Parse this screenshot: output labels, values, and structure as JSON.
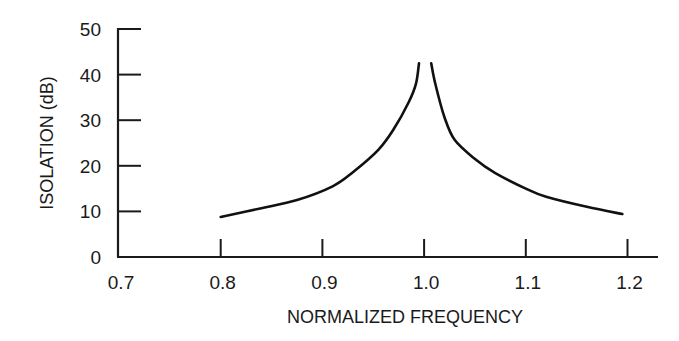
{
  "chart_data": {
    "type": "line",
    "title": "",
    "xlabel": "NORMALIZED FREQUENCY",
    "ylabel": "ISOLATION (dB)",
    "xlim": [
      0.7,
      1.22
    ],
    "ylim": [
      0,
      50
    ],
    "xticks": [
      "0.7",
      "0.8",
      "0.9",
      "1.0",
      "1.1",
      "1.2"
    ],
    "yticks": [
      "0",
      "10",
      "20",
      "30",
      "40",
      "50"
    ],
    "grid": false,
    "legend": null,
    "series": [
      {
        "name": "isolation-lower-branch",
        "x": [
          0.8,
          0.84,
          0.875,
          0.91,
          0.93,
          0.955,
          0.97,
          0.985,
          0.992,
          0.995
        ],
        "y": [
          8.8,
          10.7,
          12.5,
          15.5,
          18.6,
          23.5,
          28.0,
          34.0,
          38.0,
          42.5
        ]
      },
      {
        "name": "isolation-upper-branch",
        "x": [
          1.007,
          1.011,
          1.02,
          1.03,
          1.05,
          1.07,
          1.1,
          1.12,
          1.16,
          1.195
        ],
        "y": [
          42.5,
          38.0,
          30.7,
          25.7,
          21.5,
          18.4,
          15.0,
          13.2,
          11.0,
          9.4
        ]
      }
    ],
    "colors": {
      "line": "#111111",
      "axis": "#1a1a1a",
      "background": "#ffffff"
    }
  }
}
